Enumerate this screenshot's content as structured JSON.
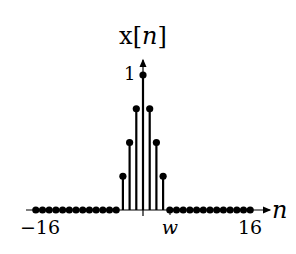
{
  "chart_data": {
    "type": "stem",
    "title": "x[n]",
    "ylabel": "x[n]",
    "xlabel": "n",
    "x_tick_labels": [
      {
        "value": -16,
        "label": "−16"
      },
      {
        "value": 4,
        "label": "w"
      },
      {
        "value": 16,
        "label": "16"
      }
    ],
    "y_tick_labels": [
      {
        "value": 1,
        "label": "1"
      }
    ],
    "xlim": [
      -16,
      16
    ],
    "ylim": [
      0,
      1
    ],
    "grid": false,
    "x": [
      -16,
      -15,
      -14,
      -13,
      -12,
      -11,
      -10,
      -9,
      -8,
      -7,
      -6,
      -5,
      -4,
      -3,
      -2,
      -1,
      0,
      1,
      2,
      3,
      4,
      5,
      6,
      7,
      8,
      9,
      10,
      11,
      12,
      13,
      14,
      15,
      16
    ],
    "values": [
      0,
      0,
      0,
      0,
      0,
      0,
      0,
      0,
      0,
      0,
      0,
      0,
      0,
      0.25,
      0.5,
      0.75,
      1,
      0.75,
      0.5,
      0.25,
      0,
      0,
      0,
      0,
      0,
      0,
      0,
      0,
      0,
      0,
      0,
      0,
      0
    ]
  },
  "labels": {
    "title_x": "x",
    "title_n": "n",
    "y_one": "1",
    "x_axis_n": "n",
    "tick_left": "−16",
    "tick_w": "w",
    "tick_right": "16"
  }
}
